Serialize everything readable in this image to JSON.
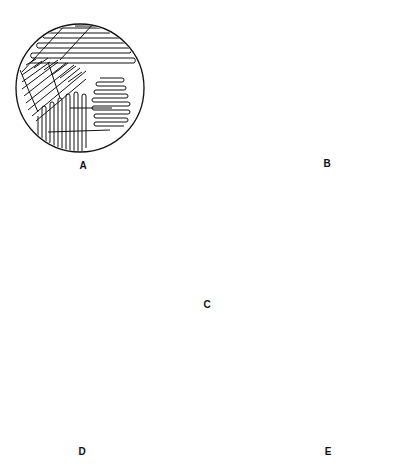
{
  "figure": {
    "ink_color": "#111111",
    "background": "#ffffff",
    "panels": [
      {
        "label": "A",
        "pattern": "four-quadrant-overlapping-streaks"
      },
      {
        "label": "B",
        "pattern": "radial-streaks-from-point"
      },
      {
        "label": "C",
        "pattern": "continuous-zigzag-streak"
      },
      {
        "label": "D",
        "pattern": "quadrant-concentric-arc-streaks"
      },
      {
        "label": "E",
        "pattern": "three-sector-zigzag-streaks"
      }
    ]
  }
}
